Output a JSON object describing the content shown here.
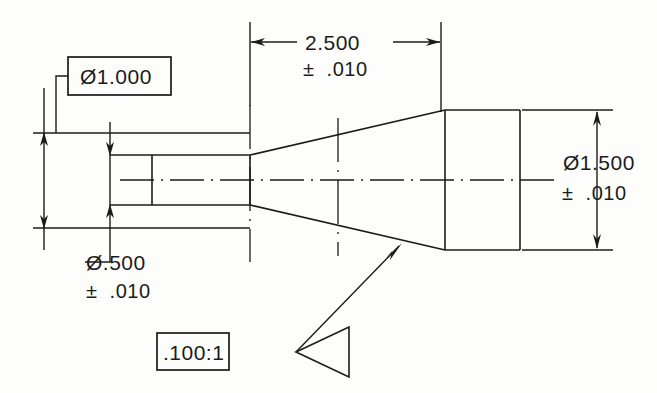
{
  "drawing": {
    "title": "Tapered Shaft Dimensioned Drawing",
    "background_color": "#fdfdfc",
    "line_color": "#1b1b1b",
    "view": "section / outline view of a stepped conical shaft",
    "annotations": {
      "outer_diameter_small": {
        "label": "Ø1.000",
        "boxed": true,
        "name": "outer-diameter-callout"
      },
      "bore_diameter": {
        "label": "Ø.500",
        "tolerance": "±  .010",
        "boxed": false,
        "name": "bore-diameter-callout"
      },
      "length": {
        "label": "2.500",
        "tolerance": "±  .010",
        "boxed": false,
        "name": "length-dimension"
      },
      "large_diameter": {
        "label": "Ø1.500",
        "tolerance": "±  .010",
        "boxed": false,
        "name": "large-diameter-dimension"
      },
      "taper_note": {
        "label": ".100:1",
        "boxed": true,
        "name": "taper-ratio-callout"
      }
    },
    "geometry": {
      "small_body_top_y": 133,
      "small_body_bottom_y": 228,
      "bore_top_y": 155,
      "bore_bottom_y": 205,
      "bore_left_x": 152,
      "bore_right_x": 250,
      "centerline_y": 180,
      "cone_start_x": 250,
      "cone_end_x": 445,
      "large_body_left_x": 445,
      "large_body_right_x": 520,
      "large_body_top_y": 110,
      "large_body_bottom_y": 250
    }
  }
}
